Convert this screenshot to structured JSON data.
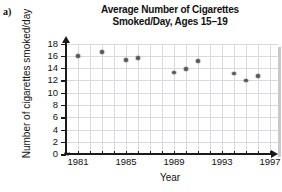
{
  "part_label": "a)",
  "chart_data": {
    "type": "scatter",
    "title": "Average Number of Cigarettes Smoked/Day, Ages 15–19",
    "title_line1": "Average Number of Cigarettes",
    "title_line2": "Smoked/Day, Ages 15–19",
    "xlabel": "Year",
    "ylabel": "Number of cigarettes smoked/day",
    "x": [
      1981,
      1983,
      1985,
      1986,
      1989,
      1990,
      1991,
      1994,
      1995,
      1996
    ],
    "values": [
      16.0,
      16.6,
      15.3,
      15.6,
      13.3,
      13.9,
      15.2,
      13.1,
      12.0,
      12.7
    ],
    "points": [
      {
        "year": 1981,
        "value": 16.0
      },
      {
        "year": 1983,
        "value": 16.6
      },
      {
        "year": 1985,
        "value": 15.3
      },
      {
        "year": 1986,
        "value": 15.6
      },
      {
        "year": 1989,
        "value": 13.3
      },
      {
        "year": 1990,
        "value": 13.9
      },
      {
        "year": 1991,
        "value": 15.2
      },
      {
        "year": 1994,
        "value": 13.1
      },
      {
        "year": 1995,
        "value": 12.0
      },
      {
        "year": 1996,
        "value": 12.7
      }
    ],
    "xlim": [
      1980,
      1997.5
    ],
    "ylim": [
      0,
      19
    ],
    "xticks": [
      1981,
      1982,
      1983,
      1984,
      1985,
      1986,
      1987,
      1988,
      1989,
      1990,
      1991,
      1992,
      1993,
      1994,
      1995,
      1996,
      1997
    ],
    "xtick_labels": [
      {
        "value": 1981,
        "label": "1981"
      },
      {
        "value": 1985,
        "label": "1985"
      },
      {
        "value": 1989,
        "label": "1989"
      },
      {
        "value": 1993,
        "label": "1993"
      },
      {
        "value": 1997,
        "label": "1997"
      }
    ],
    "yticks": [
      0,
      2,
      4,
      6,
      8,
      10,
      12,
      14,
      16,
      18
    ],
    "ytick_labels": [
      "0",
      "2",
      "4",
      "6",
      "8",
      "10",
      "12",
      "14",
      "16",
      "18"
    ],
    "grid": true,
    "legend": "none",
    "axis_break": true,
    "marker_color": "#5a5a5a",
    "grid_color": "#d9d9e2",
    "axis_color": "#1a1a1a"
  }
}
